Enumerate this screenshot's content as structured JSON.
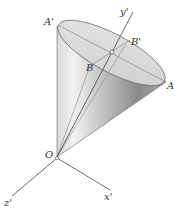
{
  "diagram": {
    "labels": {
      "A_prime": "A'",
      "A": "A",
      "B_prime": "B'",
      "B": "B",
      "O": "O",
      "x_prime": "x'",
      "y_prime": "y'",
      "z_prime": "z'"
    },
    "colors": {
      "cone_light": "#e6e6e6",
      "cone_dark": "#8e8e8e",
      "ellipse_fill": "#dcdcdc",
      "line": "#444444"
    }
  }
}
